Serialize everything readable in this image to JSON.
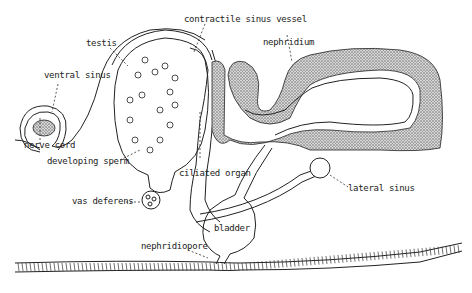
{
  "diagram": {
    "labels": {
      "contractile_sinus_vessel": "contractile sinus vessel",
      "testis": "testis",
      "nephridium": "nephridium",
      "ventral_sinus": "ventral sinus",
      "nerve_cord": "nerve cord",
      "developing_sperm": "developing sperm",
      "ciliated_organ": "ciliated organ",
      "lateral_sinus": "lateral sinus",
      "vas_deferens": "vas deferens",
      "bladder": "bladder",
      "nephridiopore": "nephridiopore"
    },
    "colors": {
      "ink": "#222222",
      "background": "#ffffff",
      "stipple": "#888888"
    }
  }
}
